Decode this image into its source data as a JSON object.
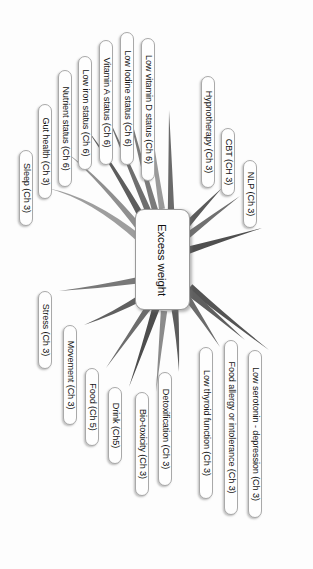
{
  "diagram": {
    "orientation_degrees": 90,
    "background_color": "#fdfdfd",
    "central_node": {
      "label": "Excess weight",
      "fill": "#fdfdfd",
      "border_color": "#9a9a9a"
    },
    "node_style": {
      "fill": "#fefefe",
      "border_color": "#a9a9a9",
      "text_color": "#141414"
    },
    "nodes": [
      {
        "label": "Sleep (Ch 3)",
        "chapter": "Ch 3",
        "branch_color": "#9e9e9e",
        "box": {
          "x": 33,
          "y": 150,
          "w": 14,
          "h": 76
        },
        "anchor": {
          "x": 47,
          "y": 188
        },
        "ctrl": {
          "x": 92,
          "y": 198
        },
        "hub": {
          "x": 140,
          "y": 239
        },
        "thick": 7.0
      },
      {
        "label": "Gut health (Ch 3)",
        "chapter": "Ch 3",
        "branch_color": "#8f8f8f",
        "box": {
          "x": 52,
          "y": 104,
          "w": 14,
          "h": 95
        },
        "anchor": {
          "x": 66,
          "y": 152
        },
        "ctrl": {
          "x": 101,
          "y": 180
        },
        "hub": {
          "x": 141,
          "y": 230
        },
        "thick": 6.6
      },
      {
        "label": "Nutrient status (Ch 6)",
        "chapter": "Ch 6",
        "branch_color": "#5d5d5d",
        "box": {
          "x": 72,
          "y": 70,
          "w": 14,
          "h": 117
        },
        "anchor": {
          "x": 86,
          "y": 128
        },
        "ctrl": {
          "x": 112,
          "y": 163
        },
        "hub": {
          "x": 144,
          "y": 221
        },
        "thick": 6.8
      },
      {
        "label": "Low iron status (Ch 6)",
        "chapter": "Ch 6",
        "branch_color": "#6e6e6e",
        "box": {
          "x": 92,
          "y": 56,
          "w": 14,
          "h": 114
        },
        "anchor": {
          "x": 106,
          "y": 113
        },
        "ctrl": {
          "x": 124,
          "y": 154
        },
        "hub": {
          "x": 149,
          "y": 213
        },
        "thick": 6.4
      },
      {
        "label": "Vitamin A status (Ch 6)",
        "chapter": "Ch 6",
        "branch_color": "#7a7a7a",
        "box": {
          "x": 113,
          "y": 40,
          "w": 14,
          "h": 125
        },
        "anchor": {
          "x": 127,
          "y": 103
        },
        "ctrl": {
          "x": 137,
          "y": 148
        },
        "hub": {
          "x": 155,
          "y": 210
        },
        "thick": 6.2
      },
      {
        "label": "Low Iodine status (Ch 6)",
        "chapter": "Ch 6",
        "branch_color": "#9a9a9a",
        "box": {
          "x": 134,
          "y": 32,
          "w": 14,
          "h": 133
        },
        "anchor": {
          "x": 148,
          "y": 99
        },
        "ctrl": {
          "x": 152,
          "y": 146
        },
        "hub": {
          "x": 162,
          "y": 209
        },
        "thick": 6.0
      },
      {
        "label": "Low vitamin D status (Ch 6)",
        "chapter": "Ch 6",
        "branch_color": "#6a6a6a",
        "box": {
          "x": 155,
          "y": 38,
          "w": 14,
          "h": 143
        },
        "anchor": {
          "x": 169,
          "y": 110
        },
        "ctrl": {
          "x": 170,
          "y": 152
        },
        "hub": {
          "x": 171,
          "y": 210
        },
        "thick": 6.3
      },
      {
        "label": "Hypnotherapy (Ch 3)",
        "chapter": "Ch 3",
        "branch_color": "#5a5a5a",
        "box": {
          "x": 215,
          "y": 76,
          "w": 14,
          "h": 112
        },
        "anchor": {
          "x": 222,
          "y": 188
        },
        "ctrl": {
          "x": 205,
          "y": 205
        },
        "hub": {
          "x": 185,
          "y": 227
        },
        "thick": 6.8
      },
      {
        "label": "CBT (CH 3)",
        "chapter": "CH 3",
        "branch_color": "#707070",
        "box": {
          "x": 235,
          "y": 128,
          "w": 14,
          "h": 68
        },
        "anchor": {
          "x": 240,
          "y": 196
        },
        "ctrl": {
          "x": 214,
          "y": 215
        },
        "hub": {
          "x": 187,
          "y": 236
        },
        "thick": 6.5
      },
      {
        "label": "NLP (Ch 3)",
        "chapter": "Ch 3",
        "branch_color": "#4f4f4f",
        "box": {
          "x": 257,
          "y": 160,
          "w": 14,
          "h": 68
        },
        "anchor": {
          "x": 262,
          "y": 228
        },
        "ctrl": {
          "x": 222,
          "y": 240
        },
        "hub": {
          "x": 189,
          "y": 250
        },
        "thick": 7.2
      },
      {
        "label": "Low serotonin - depression (Ch 3)",
        "chapter": "Ch 3",
        "branch_color": "#545454",
        "box": {
          "x": 262,
          "y": 350,
          "w": 14,
          "h": 168
        },
        "anchor": {
          "x": 269,
          "y": 350
        },
        "ctrl": {
          "x": 227,
          "y": 318
        },
        "hub": {
          "x": 190,
          "y": 287
        },
        "thick": 7.2
      },
      {
        "label": "Food allergy or intolerance (Ch 3)",
        "chapter": "Ch 3",
        "branch_color": "#5f5f5f",
        "box": {
          "x": 238,
          "y": 340,
          "w": 14,
          "h": 175
        },
        "anchor": {
          "x": 245,
          "y": 340
        },
        "ctrl": {
          "x": 216,
          "y": 315
        },
        "hub": {
          "x": 189,
          "y": 292
        },
        "thick": 6.9
      },
      {
        "label": "Low thyroid function (Ch 3)",
        "chapter": "Ch 3",
        "branch_color": "#6b6b6b",
        "box": {
          "x": 213,
          "y": 347,
          "w": 14,
          "h": 152
        },
        "anchor": {
          "x": 220,
          "y": 347
        },
        "ctrl": {
          "x": 204,
          "y": 322
        },
        "hub": {
          "x": 187,
          "y": 297
        },
        "thick": 6.6
      },
      {
        "label": "Detoxification (Ch 3)",
        "chapter": "Ch 3",
        "branch_color": "#5c5c5c",
        "box": {
          "x": 172,
          "y": 372,
          "w": 14,
          "h": 114
        },
        "anchor": {
          "x": 179,
          "y": 372
        },
        "ctrl": {
          "x": 178,
          "y": 338
        },
        "hub": {
          "x": 175,
          "y": 310
        },
        "thick": 6.8
      },
      {
        "label": "Bio-toxicity (Ch 3)",
        "chapter": "Ch 3",
        "branch_color": "#8b8b8b",
        "box": {
          "x": 149,
          "y": 392,
          "w": 14,
          "h": 104
        },
        "anchor": {
          "x": 156,
          "y": 392
        },
        "ctrl": {
          "x": 160,
          "y": 350
        },
        "hub": {
          "x": 164,
          "y": 311
        },
        "thick": 6.4
      },
      {
        "label": "Drink (Ch5)",
        "chapter": "Ch5",
        "branch_color": "#4d4d4d",
        "box": {
          "x": 122,
          "y": 387,
          "w": 14,
          "h": 77
        },
        "anchor": {
          "x": 129,
          "y": 387
        },
        "ctrl": {
          "x": 144,
          "y": 345
        },
        "hub": {
          "x": 156,
          "y": 308
        },
        "thick": 7.4
      },
      {
        "label": "Food (Ch 5)",
        "chapter": "Ch 5",
        "branch_color": "#6d6d6d",
        "box": {
          "x": 99,
          "y": 368,
          "w": 14,
          "h": 78
        },
        "anchor": {
          "x": 106,
          "y": 368
        },
        "ctrl": {
          "x": 128,
          "y": 337
        },
        "hub": {
          "x": 150,
          "y": 305
        },
        "thick": 6.6
      },
      {
        "label": "Movement (Ch 3)",
        "chapter": "Ch 3",
        "branch_color": "#606060",
        "box": {
          "x": 77,
          "y": 325,
          "w": 14,
          "h": 100
        },
        "anchor": {
          "x": 84,
          "y": 325
        },
        "ctrl": {
          "x": 113,
          "y": 314
        },
        "hub": {
          "x": 144,
          "y": 296
        },
        "thick": 6.9
      },
      {
        "label": "Stress (Ch 3)",
        "chapter": "Ch 3",
        "branch_color": "#787878",
        "box": {
          "x": 52,
          "y": 291,
          "w": 14,
          "h": 78
        },
        "anchor": {
          "x": 59,
          "y": 291
        },
        "ctrl": {
          "x": 99,
          "y": 287
        },
        "hub": {
          "x": 140,
          "y": 280
        },
        "thick": 6.5
      }
    ]
  }
}
